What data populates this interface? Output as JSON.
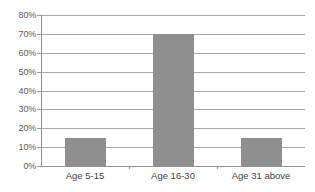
{
  "chart_data": {
    "type": "bar",
    "title": "",
    "xlabel": "",
    "ylabel": "",
    "categories": [
      "Age 5-15",
      "Age 16-30",
      "Age 31 above"
    ],
    "values": [
      15,
      70,
      15
    ],
    "value_suffix": "%",
    "ylim": [
      0,
      80
    ],
    "ytick_step": 10,
    "ytick_labels": [
      "0%",
      "10%",
      "20%",
      "30%",
      "40%",
      "50%",
      "60%",
      "70%",
      "80%"
    ],
    "ytick_values": [
      0,
      10,
      20,
      30,
      40,
      50,
      60,
      70,
      80
    ],
    "grid": true,
    "legend": false,
    "legend_position": "none",
    "colors": {
      "bar_fill": "#8f8f8f",
      "gridline": "#a8a8a8",
      "axis_line": "#909090",
      "tick_label": "#5a5a5a",
      "category_label": "#3f3f3f",
      "background": "#ffffff"
    }
  }
}
